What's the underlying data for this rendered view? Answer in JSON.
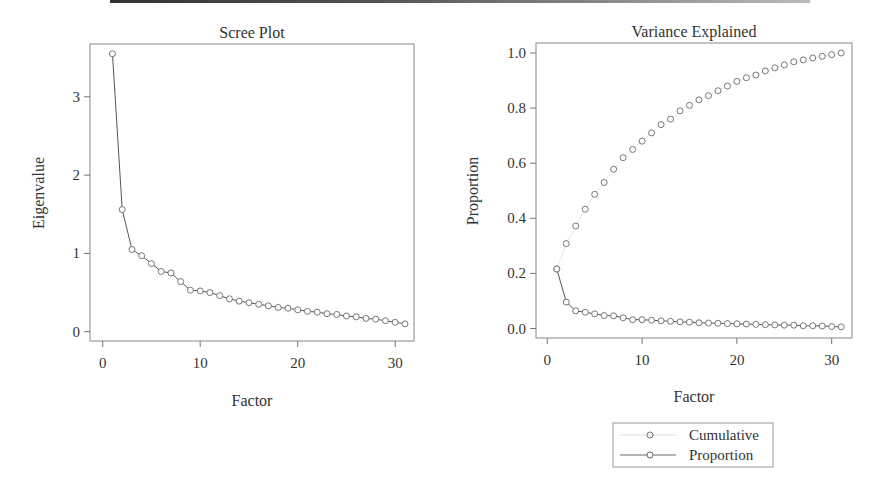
{
  "chart_data": [
    {
      "type": "line",
      "title": "Scree Plot",
      "xlabel": "Factor",
      "ylabel": "Eigenvalue",
      "xlim": [
        0,
        31
      ],
      "ylim": [
        0,
        3.6
      ],
      "xticks": [
        0,
        10,
        20,
        30
      ],
      "yticks": [
        0,
        1,
        2,
        3
      ],
      "grid": false,
      "x": [
        1,
        2,
        3,
        4,
        5,
        6,
        7,
        8,
        9,
        10,
        11,
        12,
        13,
        14,
        15,
        16,
        17,
        18,
        19,
        20,
        21,
        22,
        23,
        24,
        25,
        26,
        27,
        28,
        29,
        30,
        31
      ],
      "series": [
        {
          "name": "Eigenvalue",
          "values": [
            3.55,
            1.56,
            1.05,
            0.97,
            0.87,
            0.77,
            0.75,
            0.64,
            0.53,
            0.52,
            0.5,
            0.46,
            0.42,
            0.39,
            0.37,
            0.35,
            0.33,
            0.31,
            0.3,
            0.28,
            0.26,
            0.25,
            0.23,
            0.22,
            0.2,
            0.19,
            0.17,
            0.16,
            0.14,
            0.12,
            0.1
          ],
          "style": "line+circle"
        }
      ]
    },
    {
      "type": "line",
      "title": "Variance Explained",
      "xlabel": "Factor",
      "ylabel": "Proportion",
      "xlim": [
        0,
        31
      ],
      "ylim": [
        0,
        1.0
      ],
      "xticks": [
        0,
        10,
        20,
        30
      ],
      "yticks": [
        0.0,
        0.2,
        0.4,
        0.6,
        0.8,
        1.0
      ],
      "ytick_labels": [
        "0.0",
        "0.2",
        "0.4",
        "0.6",
        "0.8",
        "1.0"
      ],
      "grid": false,
      "legend_position": "bottom",
      "x": [
        1,
        2,
        3,
        4,
        5,
        6,
        7,
        8,
        9,
        10,
        11,
        12,
        13,
        14,
        15,
        16,
        17,
        18,
        19,
        20,
        21,
        22,
        23,
        24,
        25,
        26,
        27,
        28,
        29,
        30,
        31
      ],
      "series": [
        {
          "name": "Cumulative",
          "values": [
            0.216,
            0.308,
            0.372,
            0.433,
            0.487,
            0.53,
            0.578,
            0.62,
            0.65,
            0.68,
            0.71,
            0.74,
            0.76,
            0.79,
            0.81,
            0.83,
            0.845,
            0.863,
            0.88,
            0.897,
            0.91,
            0.92,
            0.935,
            0.946,
            0.957,
            0.968,
            0.975,
            0.982,
            0.988,
            0.994,
            1.0
          ],
          "style": "circle-only"
        },
        {
          "name": "Proportion",
          "values": [
            0.216,
            0.096,
            0.064,
            0.059,
            0.053,
            0.047,
            0.046,
            0.039,
            0.032,
            0.032,
            0.03,
            0.028,
            0.026,
            0.024,
            0.023,
            0.021,
            0.02,
            0.019,
            0.018,
            0.017,
            0.016,
            0.015,
            0.014,
            0.013,
            0.012,
            0.012,
            0.01,
            0.01,
            0.009,
            0.007,
            0.006
          ],
          "style": "line+circle"
        }
      ]
    }
  ],
  "left_chart": {
    "title": "Scree Plot",
    "xlabel": "Factor",
    "ylabel": "Eigenvalue",
    "xtick_labels": [
      "0",
      "10",
      "20",
      "30"
    ],
    "ytick_labels": [
      "0",
      "1",
      "2",
      "3"
    ]
  },
  "right_chart": {
    "title": "Variance Explained",
    "xlabel": "Factor",
    "ylabel": "Proportion",
    "xtick_labels": [
      "0",
      "10",
      "20",
      "30"
    ],
    "ytick_labels": [
      "0.0",
      "0.2",
      "0.4",
      "0.6",
      "0.8",
      "1.0"
    ]
  },
  "legend": {
    "items": [
      {
        "label": "Cumulative",
        "style": "circle-only"
      },
      {
        "label": "Proportion",
        "style": "line+circle"
      }
    ]
  },
  "colors": {
    "line": "#555555",
    "marker": "#666666",
    "axis": "#666666",
    "text": "#333333"
  }
}
